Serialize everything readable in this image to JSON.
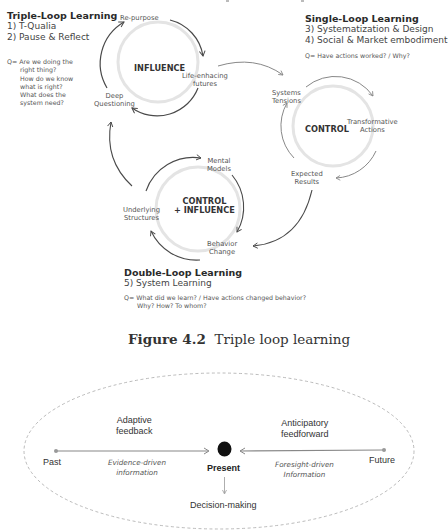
{
  "figure_top": {
    "triple_loop": {
      "title": "Triple-Loop Learning",
      "items": [
        "1) T-Qualia",
        "2) Pause & Reflect"
      ],
      "question_prefix": "Q=",
      "questions": [
        "Are we doing the",
        "right thing?",
        "How do we know",
        "what is right?",
        "What does the",
        "system need?"
      ]
    },
    "single_loop": {
      "title": "Single-Loop Learning",
      "items": [
        "3) Systematization & Design",
        "4) Social & Market embodiment"
      ],
      "question": "Q= Have actions worked? / Why?"
    },
    "double_loop": {
      "title": "Double-Loop Learning",
      "items": [
        "5) System Learning"
      ],
      "question_line1": "Q= What did we learn? / Have actions changed behavior?",
      "question_line2": "Why? How? To whom?"
    },
    "influence_loop": {
      "center": "INFLUENCE",
      "nodes": {
        "top": "Re-purpose",
        "right_1": "Life-enhacing",
        "right_2": "futures",
        "left_1": "Deep",
        "left_2": "Questioning"
      }
    },
    "control_loop": {
      "center": "CONTROL",
      "nodes": {
        "top_1": "Systems",
        "top_2": "Tensions",
        "right_1": "Transformative",
        "right_2": "Actions",
        "bottom_1": "Expected",
        "bottom_2": "Results"
      }
    },
    "control_influence_loop": {
      "center_1": "CONTROL",
      "center_2": "+ INFLUENCE",
      "nodes": {
        "top_1": "Mental",
        "top_2": "Models",
        "bottom_1": "Behavior",
        "bottom_2": "Change",
        "left_1": "Underlying",
        "left_2": "Structures"
      }
    },
    "caption": {
      "figure_label": "Figure 4.2",
      "title": "Triple loop learning"
    }
  },
  "figure_bottom": {
    "past": "Past",
    "present": "Present",
    "future": "Future",
    "left_top_1": "Adaptive",
    "left_top_2": "feedback",
    "left_bottom_1": "Evidence-driven",
    "left_bottom_2": "information",
    "right_top_1": "Anticipatory",
    "right_top_2": "feedforward",
    "right_bottom_1": "Foresight-driven",
    "right_bottom_2": "Information",
    "decision": "Decision-making"
  },
  "colors": {
    "arrow_dark": "#4a4a4a",
    "arrow_light": "#d9d9d9",
    "dashed": "#aaaaaa",
    "dot": "#111111"
  }
}
